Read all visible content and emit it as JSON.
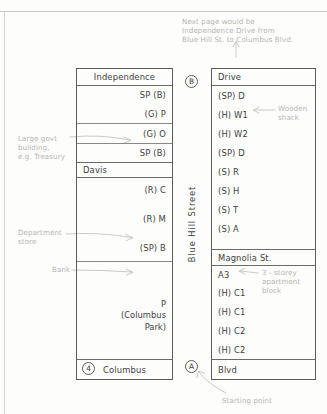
{
  "annotations": {
    "next_page": "Next page would be\nIndependence Drive from\nBlue Hill St. to Columbus Blvd.",
    "govt_building": "Large govt\nbuilding,\ne.g. Treasury",
    "department_store": "Department\nstore",
    "bank": "Bank",
    "wooden_shack": "Wooden\nshack",
    "apartment_block": "3 - storey\napartment\nblock",
    "starting_point": "Starting point"
  },
  "left_column": {
    "header": "Independence",
    "rows": [
      {
        "label": "SP (B)",
        "align": "right"
      },
      {
        "label": "(G)  P",
        "align": "right"
      },
      {
        "label": "(G) O",
        "align": "right"
      },
      {
        "label": "SP (B)",
        "align": "right"
      }
    ],
    "section2_header": "Davis",
    "section2_rows": [
      {
        "label": "(R) C",
        "align": "right"
      },
      {
        "label": "(R) M",
        "align": "right"
      },
      {
        "label": "(SP) B",
        "align": "right"
      }
    ],
    "park_label": "P\n(Columbus\nPark)",
    "footer": "Columbus",
    "footer_marker": "4"
  },
  "middle_column": {
    "top_marker": "B",
    "street_name": "Blue  Hill  Street",
    "bottom_marker": "A"
  },
  "right_column": {
    "header": "Drive",
    "rows": [
      {
        "label": "(SP) D"
      },
      {
        "label": "(H) W1"
      },
      {
        "label": "(H) W2"
      },
      {
        "label": "(SP) D"
      },
      {
        "label": "(S) R"
      },
      {
        "label": "(S) H"
      },
      {
        "label": "(S) T"
      },
      {
        "label": "(S) A"
      }
    ],
    "section2_header": "Magnolia St.",
    "section2_rows": [
      {
        "label": "A3"
      },
      {
        "label": "(H) C1"
      },
      {
        "label": "(H) C1"
      },
      {
        "label": "(H) C2"
      },
      {
        "label": "(H) C2"
      }
    ],
    "footer": "Blvd"
  },
  "colors": {
    "ink": "#40403d",
    "border": "#5b5b58",
    "pencil": "#b4b4b0",
    "paper": "#fdfdfb"
  }
}
